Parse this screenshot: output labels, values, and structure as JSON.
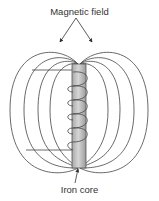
{
  "diagram": {
    "labels": {
      "top": "Magnetic field",
      "bottom": "Iron core"
    },
    "components": {
      "core": "iron core (vertical bar)",
      "coil": "wire coil wound around core",
      "leads": "two wire leads extending left",
      "field_lines": "magnetic field line loops on both sides"
    },
    "colors": {
      "line": "#444444",
      "core_fill": "#bdbdbd",
      "core_highlight": "#d8d8d8",
      "text": "#333333",
      "background": "#ffffff"
    }
  }
}
